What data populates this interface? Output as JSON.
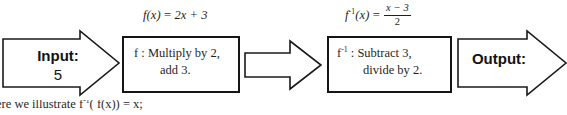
{
  "diagram": {
    "formulas": {
      "f": {
        "lhs_fn": "f",
        "lhs_arg": "(x)",
        "equals": "=",
        "rhs": "2x + 3",
        "plain": "f(x) = 2x + 3"
      },
      "f_inverse": {
        "lhs_fn": "f",
        "lhs_sup": "-1",
        "lhs_arg": "(x)",
        "equals": "=",
        "numerator": "x − 3",
        "denominator": "2",
        "plain": "f^-1(x) = (x - 3)/2"
      }
    },
    "input_arrow": {
      "label": "Input:",
      "value": "5",
      "shape": "block-arrow-right"
    },
    "box_f": {
      "symbol": "f",
      "symbol_sup": "",
      "separator": ":",
      "line1": "Multiply by 2,",
      "line2": "add 3.",
      "plain": "f : Multiply by 2, add 3."
    },
    "middle_arrow": {
      "label": "",
      "shape": "block-arrow-right"
    },
    "box_f_inverse": {
      "symbol": "f",
      "symbol_sup": "-1",
      "separator": ":",
      "line1": "Subtract 3,",
      "line2": "divide by 2.",
      "plain": "f^-1 : Subtract 3, divide by 2."
    },
    "output_arrow": {
      "label": "Output:",
      "value": "",
      "shape": "block-arrow-right"
    },
    "caption": {
      "text_before": "ere we illustrate",
      "expression_fn": "f",
      "expression_sup": "-1",
      "expression_rest": "( f(x)) = x;",
      "plain": "ere we illustrate f^-1( f(x)) = x;"
    },
    "colors": {
      "stroke": "#1a1a1a",
      "box_stroke": "#151515",
      "text": "#1f1f1f",
      "background": "#ffffff"
    }
  }
}
